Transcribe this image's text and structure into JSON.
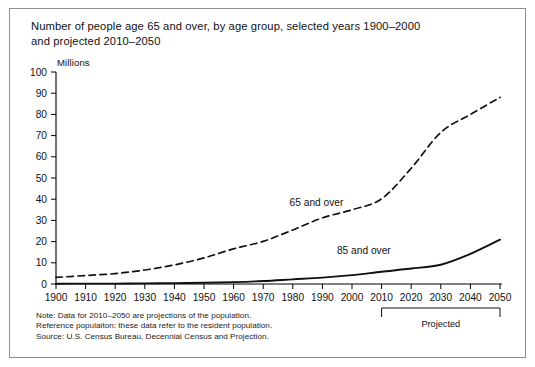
{
  "figure": {
    "title_lines": [
      "Number of people age 65 and over, by age group, selected years 1900–2000",
      "and projected 2010–2050"
    ],
    "notes": [
      "Note: Data for 2010–2050 are projections of the population.",
      "Reference populaiton: these data refer to the resident population.",
      "Source: U.S. Census Bureau, Decennial Census and Projection."
    ],
    "projected_bracket_label": "Projected",
    "colors": {
      "ink": "#111111",
      "axis": "#000000",
      "frame": "#8d8d8d",
      "background": "#ffffff"
    }
  },
  "chart_data": {
    "type": "line",
    "title": "Number of people age 65 and over, by age group, selected years 1900–2000 and projected 2010–2050",
    "xlabel": "",
    "ylabel": "Millions",
    "unit_label": "Millions",
    "xlim": [
      1900,
      2050
    ],
    "ylim": [
      0,
      100
    ],
    "ytick_step": 10,
    "grid": false,
    "legend": "inline-annotations",
    "x": [
      1900,
      1910,
      1920,
      1930,
      1940,
      1950,
      1960,
      1970,
      1980,
      1990,
      2000,
      2010,
      2020,
      2030,
      2040,
      2050
    ],
    "xtick_labels": [
      "1900",
      "1910",
      "1920",
      "1930",
      "1940",
      "1950",
      "1960",
      "1970",
      "1980",
      "1990",
      "2000",
      "2010",
      "2020",
      "2030",
      "2040",
      "2050"
    ],
    "ytick_labels": [
      "0",
      "10",
      "20",
      "30",
      "40",
      "50",
      "60",
      "70",
      "80",
      "90",
      "100"
    ],
    "projected_from": 2010,
    "series": [
      {
        "name": "65 and over",
        "style": "dashed",
        "label_x": 1988,
        "label_y": 37,
        "values": [
          3.1,
          4.0,
          4.9,
          6.6,
          9.0,
          12.3,
          16.6,
          20.1,
          25.5,
          31.2,
          35.0,
          40.2,
          54.6,
          71.5,
          80.0,
          88.0
        ]
      },
      {
        "name": "85 and over",
        "style": "solid",
        "label_x": 2004,
        "label_y": 14,
        "values": [
          0.1,
          0.2,
          0.2,
          0.3,
          0.4,
          0.6,
          0.9,
          1.4,
          2.2,
          3.0,
          4.2,
          5.8,
          7.3,
          9.1,
          14.2,
          20.9
        ]
      }
    ],
    "annotations": [
      {
        "text": "65 and over",
        "x": 1988,
        "y": 37
      },
      {
        "text": "85 and over",
        "x": 2004,
        "y": 14
      },
      {
        "text": "Projected",
        "x": 2030,
        "y": -14
      }
    ]
  }
}
